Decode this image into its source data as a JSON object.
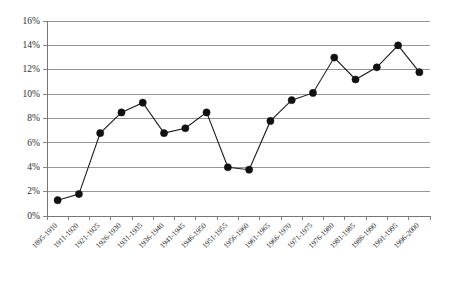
{
  "chart_data": {
    "type": "line",
    "title": "",
    "subtitle": "",
    "xlabel": "",
    "ylabel": "",
    "categories": [
      "1895-1910",
      "1911-1920",
      "1921-1925",
      "1926-1930",
      "1931-1935",
      "1936-1940",
      "1941-1945",
      "1946-1950",
      "1951-1955",
      "1956-1960",
      "1961-1965",
      "1966-1970",
      "1971-1975",
      "1976-1980",
      "1981-1985",
      "1986-1990",
      "1991-1995",
      "1996-2000"
    ],
    "values": [
      1.3,
      1.8,
      6.8,
      8.5,
      9.3,
      6.8,
      7.2,
      8.5,
      4.0,
      3.8,
      7.8,
      9.5,
      10.1,
      13.0,
      11.2,
      12.2,
      14.0,
      11.8
    ],
    "ylim": [
      0,
      16
    ],
    "ytick_values": [
      0,
      2,
      4,
      6,
      8,
      10,
      12,
      14,
      16
    ],
    "ytick_labels": [
      "0%",
      "2%",
      "4%",
      "6%",
      "8%",
      "10%",
      "12%",
      "14%",
      "16%"
    ],
    "grid": true,
    "grid_axis": "y",
    "legend": false,
    "legend_position": "none",
    "marker": "filled-circle",
    "line_color": "#1a1a1a",
    "marker_color": "#111111",
    "grid_color": "#8c8c8c",
    "axis_color": "#777777",
    "background_color": "#ffffff",
    "xtick_label_rotation": -45
  }
}
